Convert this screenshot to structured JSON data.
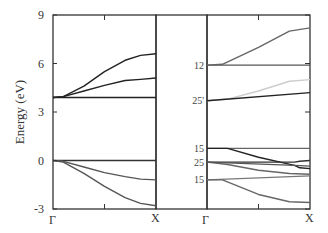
{
  "chart_data": {
    "type": "line",
    "title": "",
    "ylabel": "Energy (eV)",
    "ylim": [
      -3,
      9
    ],
    "yticks": [
      -3,
      0,
      3,
      6,
      9
    ],
    "grid": false,
    "panels": [
      {
        "name": "left",
        "xlabels": [
          "Γ",
          "X"
        ],
        "series": [
          {
            "name": "band-flat-3.9",
            "color": "#222222",
            "points": [
              [
                0,
                3.9
              ],
              [
                1,
                3.9
              ]
            ]
          },
          {
            "name": "band-upper",
            "color": "#222222",
            "points": [
              [
                0,
                3.9
              ],
              [
                0.1,
                3.95
              ],
              [
                0.3,
                4.6
              ],
              [
                0.5,
                5.5
              ],
              [
                0.7,
                6.2
              ],
              [
                0.85,
                6.5
              ],
              [
                1,
                6.6
              ]
            ]
          },
          {
            "name": "band-middle",
            "color": "#222222",
            "points": [
              [
                0,
                3.9
              ],
              [
                0.1,
                3.95
              ],
              [
                0.3,
                4.3
              ],
              [
                0.5,
                4.65
              ],
              [
                0.7,
                4.95
              ],
              [
                0.85,
                5.02
              ],
              [
                1,
                5.1
              ]
            ]
          },
          {
            "name": "band-valence-0",
            "color": "#333333",
            "points": [
              [
                0,
                0
              ],
              [
                1,
                0
              ]
            ]
          },
          {
            "name": "band-valence-1",
            "color": "#555555",
            "points": [
              [
                0,
                0
              ],
              [
                0.1,
                -0.05
              ],
              [
                0.3,
                -0.4
              ],
              [
                0.5,
                -0.75
              ],
              [
                0.7,
                -1.0
              ],
              [
                0.85,
                -1.15
              ],
              [
                1,
                -1.2
              ]
            ]
          },
          {
            "name": "band-valence-2",
            "color": "#555555",
            "points": [
              [
                0,
                0
              ],
              [
                0.1,
                -0.1
              ],
              [
                0.3,
                -0.8
              ],
              [
                0.5,
                -1.6
              ],
              [
                0.7,
                -2.3
              ],
              [
                0.85,
                -2.65
              ],
              [
                1,
                -2.8
              ]
            ]
          }
        ]
      },
      {
        "name": "right",
        "xlabels": [
          "Γ",
          "X"
        ],
        "band_labels": [
          {
            "text": "12",
            "energy": 5.9
          },
          {
            "text": "25'",
            "energy": 3.7
          },
          {
            "text": "15",
            "energy": 0.75
          },
          {
            "text": "25",
            "energy": -0.1
          },
          {
            "text": "15",
            "energy": -1.2
          }
        ],
        "series": [
          {
            "name": "band-12-flat",
            "color": "#555555",
            "points": [
              [
                0,
                5.9
              ],
              [
                1,
                5.9
              ]
            ]
          },
          {
            "name": "band-12-upper",
            "color": "#666666",
            "points": [
              [
                0,
                5.9
              ],
              [
                0.15,
                5.95
              ],
              [
                0.5,
                7.0
              ],
              [
                0.8,
                8.0
              ],
              [
                1,
                8.2
              ]
            ]
          },
          {
            "name": "band-25p-light",
            "color": "#cccccc",
            "points": [
              [
                0,
                3.7
              ],
              [
                0.2,
                3.8
              ],
              [
                0.5,
                4.3
              ],
              [
                0.8,
                4.9
              ],
              [
                1,
                5.0
              ]
            ]
          },
          {
            "name": "band-25p-dark",
            "color": "#222222",
            "points": [
              [
                0,
                3.7
              ],
              [
                1,
                4.2
              ]
            ]
          },
          {
            "name": "band-15-flat",
            "color": "#666666",
            "points": [
              [
                0,
                0.75
              ],
              [
                1,
                0.75
              ]
            ]
          },
          {
            "name": "band-15-dark",
            "color": "#222222",
            "points": [
              [
                0,
                0.75
              ],
              [
                0.2,
                0.75
              ],
              [
                0.5,
                0.2
              ],
              [
                0.85,
                -0.3
              ],
              [
                0.9,
                -0.45
              ],
              [
                1,
                -0.5
              ]
            ]
          },
          {
            "name": "band-25-flat",
            "color": "#333333",
            "points": [
              [
                0,
                -0.1
              ],
              [
                0.85,
                -0.1
              ],
              [
                0.9,
                -0.05
              ],
              [
                1,
                0
              ]
            ]
          },
          {
            "name": "band-25-lower",
            "color": "#666666",
            "points": [
              [
                0,
                -0.1
              ],
              [
                0.2,
                -0.25
              ],
              [
                0.5,
                -0.6
              ],
              [
                0.8,
                -0.8
              ],
              [
                1,
                -0.85
              ]
            ]
          },
          {
            "name": "band-25-mid",
            "color": "#555555",
            "points": [
              [
                0,
                -0.1
              ],
              [
                0.85,
                -0.3
              ],
              [
                1,
                -0.35
              ]
            ]
          },
          {
            "name": "band-15-lower-flat",
            "color": "#777777",
            "points": [
              [
                0,
                -1.2
              ],
              [
                1,
                -0.95
              ]
            ]
          },
          {
            "name": "band-15-lower",
            "color": "#666666",
            "points": [
              [
                0,
                -1.2
              ],
              [
                0.15,
                -1.2
              ],
              [
                0.5,
                -2.1
              ],
              [
                0.8,
                -2.55
              ],
              [
                1,
                -2.6
              ]
            ]
          }
        ]
      }
    ]
  },
  "axis": {
    "ylabel": "Energy (eV)",
    "yticks": [
      "9",
      "6",
      "3",
      "0",
      "-3"
    ],
    "xlabels_left": [
      "Γ",
      "X"
    ],
    "xlabels_right": [
      "Γ",
      "X"
    ]
  }
}
